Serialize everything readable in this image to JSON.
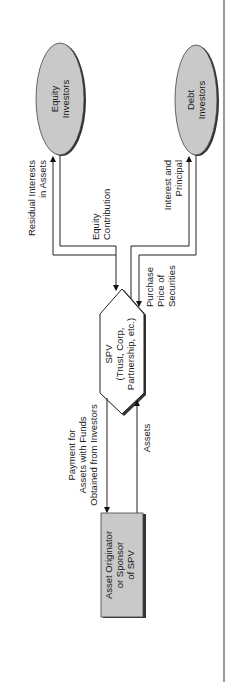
{
  "diagram": {
    "nodes": {
      "equity_investors": {
        "line1": "Equity",
        "line2": "Investors"
      },
      "debt_investors": {
        "line1": "Debt",
        "line2": "Investors"
      },
      "spv": {
        "line1": "SPV",
        "line2": "(Trust, Corp,",
        "line3": "Partnership, etc.)"
      },
      "originator": {
        "line1": "Asset Originator",
        "line2": "or Sponsor",
        "line3": "of SPV"
      }
    },
    "edges": {
      "residual_interests": {
        "line1": "Residual Interests",
        "line2": "in Assets"
      },
      "equity_contribution": {
        "line1": "Equity",
        "line2": "Contribution"
      },
      "interest_principal": {
        "line1": "Interest and",
        "line2": "Principal"
      },
      "purchase_price": {
        "line1": "Purchase",
        "line2": "Price of",
        "line3": "Securities"
      },
      "payment_for_assets": {
        "line1": "Payment for",
        "line2": "Assets with Funds",
        "line3": "Obtained from Investors"
      },
      "assets": {
        "line1": "Assets"
      }
    },
    "colors": {
      "node_fill": "#c9c9c9",
      "shadow": "#3a3a3a",
      "line": "#222222",
      "background": "#ffffff"
    }
  }
}
